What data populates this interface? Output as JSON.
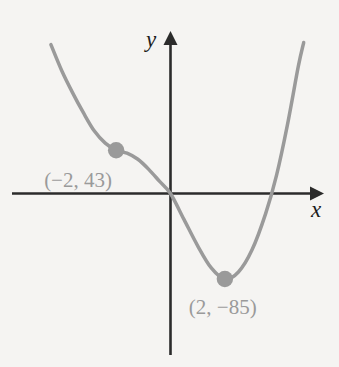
{
  "chart_data": {
    "type": "line",
    "title": "",
    "subtitle": "",
    "xlabel": "x",
    "ylabel": "y",
    "grid": false,
    "legend": "none",
    "axis_style": "arrows-both-ends",
    "xlim": [
      -5.2,
      5.8
    ],
    "ylim": [
      -160,
      150
    ],
    "tick_labels": {
      "x": [],
      "y": []
    },
    "curve_description": "cubic curve descending from upper left, flattening at a saddle point, crossing near the origin, reaching a local minimum, then rising steeply at the right",
    "series": [
      {
        "name": "cubic curve",
        "color": "#9a9a9a",
        "points": [
          {
            "x": -4.4,
            "y": 148
          },
          {
            "x": -4.0,
            "y": 122
          },
          {
            "x": -3.6,
            "y": 100
          },
          {
            "x": -3.2,
            "y": 80
          },
          {
            "x": -2.8,
            "y": 62
          },
          {
            "x": -2.4,
            "y": 50
          },
          {
            "x": -2.0,
            "y": 43
          },
          {
            "x": -1.6,
            "y": 40
          },
          {
            "x": -1.2,
            "y": 34
          },
          {
            "x": -0.8,
            "y": 24
          },
          {
            "x": -0.4,
            "y": 12
          },
          {
            "x": 0.0,
            "y": 0
          },
          {
            "x": 0.5,
            "y": -26
          },
          {
            "x": 1.0,
            "y": -52
          },
          {
            "x": 1.5,
            "y": -74
          },
          {
            "x": 2.0,
            "y": -85
          },
          {
            "x": 2.5,
            "y": -78
          },
          {
            "x": 3.0,
            "y": -56
          },
          {
            "x": 3.5,
            "y": -20
          },
          {
            "x": 3.9,
            "y": 18
          },
          {
            "x": 4.3,
            "y": 68
          },
          {
            "x": 4.7,
            "y": 126
          },
          {
            "x": 4.9,
            "y": 150
          }
        ]
      }
    ],
    "annotations": [
      {
        "id": "saddle-point",
        "label": "(−2, 43)",
        "x": -2,
        "y": 43,
        "marker": "filled-circle",
        "marker_color": "#9a9a9a",
        "label_color": "#9a9a9a"
      },
      {
        "id": "local-minimum",
        "label": "(2, −85)",
        "x": 2,
        "y": -85,
        "marker": "filled-circle",
        "marker_color": "#9a9a9a",
        "label_color": "#9a9a9a"
      }
    ],
    "colors": {
      "background": "#f5f4f2",
      "axis": "#2b2b2b",
      "curve": "#9a9a9a",
      "marker": "#9a9a9a",
      "annotation_text": "#9a9a9a",
      "axis_label_text": "#1c1c1c"
    }
  }
}
